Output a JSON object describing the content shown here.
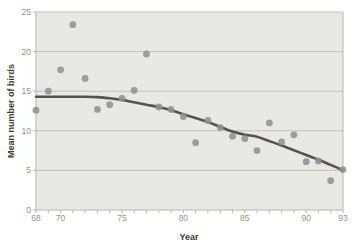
{
  "chart_data": {
    "type": "scatter",
    "title": "",
    "xlabel": "Year",
    "ylabel": "Mean number of birds",
    "xlim": [
      68,
      93
    ],
    "ylim": [
      0,
      25
    ],
    "x_major_ticks": [
      68,
      70,
      75,
      80,
      85,
      90,
      93
    ],
    "x_minor_tick_step": 1,
    "y_ticks": [
      0,
      5,
      10,
      15,
      20,
      25
    ],
    "grid": "horizontal",
    "legend_position": "none",
    "series": [
      {
        "name": "annual-mean-points",
        "type": "scatter",
        "x": [
          68,
          69,
          70,
          71,
          72,
          73,
          74,
          75,
          76,
          77,
          78,
          79,
          80,
          81,
          82,
          83,
          84,
          85,
          86,
          87,
          88,
          89,
          90,
          91,
          92,
          93
        ],
        "y": [
          12.6,
          15.0,
          17.7,
          23.4,
          16.6,
          12.7,
          13.3,
          14.1,
          15.1,
          19.7,
          13.0,
          12.7,
          11.8,
          8.5,
          11.3,
          10.4,
          9.3,
          9.0,
          7.5,
          11.0,
          8.6,
          9.5,
          6.1,
          6.2,
          3.7,
          5.1
        ]
      },
      {
        "name": "smoothed-trend-line",
        "type": "line",
        "x": [
          68,
          69,
          70,
          71,
          72,
          73,
          74,
          75,
          76,
          77,
          78,
          79,
          80,
          81,
          82,
          83,
          84,
          85,
          86,
          87,
          88,
          89,
          90,
          91,
          92,
          93
        ],
        "y": [
          14.3,
          14.3,
          14.3,
          14.3,
          14.3,
          14.25,
          14.1,
          13.9,
          13.6,
          13.3,
          13.0,
          12.6,
          12.1,
          11.6,
          11.1,
          10.5,
          9.9,
          9.5,
          9.25,
          8.7,
          8.15,
          7.55,
          6.95,
          6.35,
          5.7,
          5.0
        ]
      }
    ],
    "colors": {
      "plot_background": "#e8e9e4",
      "gridline": "#c3c0b7",
      "axis_line": "#b9b5ac",
      "tick_label": "#98928a",
      "axis_title": "#3b3a37",
      "point": "#90928f",
      "trend_line": "#565250"
    }
  }
}
